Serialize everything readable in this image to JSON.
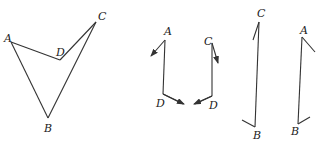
{
  "figures": [
    {
      "id": "quadrilateral",
      "description": "Concave quadrilateral ABCD",
      "points": {
        "A": {
          "x": 11,
          "y": 42
        },
        "B": {
          "x": 48,
          "y": 118
        },
        "C": {
          "x": 96,
          "y": 22
        },
        "D": {
          "x": 60,
          "y": 60
        }
      },
      "labels": [
        {
          "text": "A",
          "x": 4,
          "y": 42
        },
        {
          "text": "B",
          "x": 44,
          "y": 132
        },
        {
          "text": "C",
          "x": 98,
          "y": 20
        },
        {
          "text": "D",
          "x": 56,
          "y": 56
        }
      ],
      "edges": [
        [
          "A",
          "D"
        ],
        [
          "D",
          "C"
        ],
        [
          "C",
          "B"
        ],
        [
          "B",
          "A"
        ]
      ]
    },
    {
      "id": "path-AD",
      "points": [
        {
          "x": 165,
          "y": 40
        },
        {
          "x": 163,
          "y": 94
        },
        {
          "x": 183,
          "y": 104
        }
      ],
      "arrows": [
        {
          "from": {
            "x": 165,
            "y": 40
          },
          "to": {
            "x": 151,
            "y": 56
          }
        },
        {
          "from": {
            "x": 163,
            "y": 94
          },
          "to": {
            "x": 184,
            "y": 104
          }
        }
      ],
      "labels": [
        {
          "text": "A",
          "x": 164,
          "y": 35
        },
        {
          "text": "D",
          "x": 156,
          "y": 107
        }
      ]
    },
    {
      "id": "path-CD",
      "points": [
        {
          "x": 212,
          "y": 43
        },
        {
          "x": 212,
          "y": 96
        },
        {
          "x": 195,
          "y": 104
        }
      ],
      "arrows": [
        {
          "from": {
            "x": 212,
            "y": 43
          },
          "to": {
            "x": 218,
            "y": 63
          }
        },
        {
          "from": {
            "x": 212,
            "y": 96
          },
          "to": {
            "x": 194,
            "y": 104
          }
        }
      ],
      "labels": [
        {
          "text": "C",
          "x": 204,
          "y": 45
        },
        {
          "text": "D",
          "x": 209,
          "y": 109
        }
      ]
    },
    {
      "id": "path-CB",
      "points": [
        {
          "x": 259,
          "y": 22
        },
        {
          "x": 255,
          "y": 127
        }
      ],
      "ticks": [
        {
          "from": {
            "x": 259,
            "y": 22
          },
          "to": {
            "x": 253,
            "y": 40
          }
        },
        {
          "from": {
            "x": 255,
            "y": 127
          },
          "to": {
            "x": 242,
            "y": 120
          }
        }
      ],
      "labels": [
        {
          "text": "C",
          "x": 257,
          "y": 17
        },
        {
          "text": "B",
          "x": 253,
          "y": 139
        }
      ]
    },
    {
      "id": "path-AB",
      "points": [
        {
          "x": 302,
          "y": 37
        },
        {
          "x": 298,
          "y": 124
        }
      ],
      "ticks": [
        {
          "from": {
            "x": 302,
            "y": 37
          },
          "to": {
            "x": 315,
            "y": 52
          }
        },
        {
          "from": {
            "x": 298,
            "y": 124
          },
          "to": {
            "x": 310,
            "y": 117
          }
        }
      ],
      "labels": [
        {
          "text": "A",
          "x": 300,
          "y": 34
        },
        {
          "text": "B",
          "x": 291,
          "y": 135
        }
      ]
    }
  ],
  "colors": {
    "line": "#333333",
    "text": "#222222",
    "background": "#ffffff"
  }
}
